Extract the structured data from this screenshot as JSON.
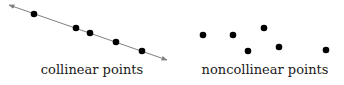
{
  "colors": {
    "point": "#000000",
    "line": "#808080",
    "text": "#1a1a1a",
    "background": "#ffffff"
  },
  "collinear": {
    "label": "collinear points",
    "line": {
      "x1": 9,
      "y1": 5,
      "x2": 167,
      "y2": 60
    },
    "points": [
      [
        34,
        14
      ],
      [
        76,
        28
      ],
      [
        90,
        33
      ],
      [
        116,
        42
      ],
      [
        142,
        51
      ]
    ]
  },
  "noncollinear": {
    "label": "noncollinear points",
    "points": [
      [
        203,
        35
      ],
      [
        233,
        35
      ],
      [
        248,
        51
      ],
      [
        264,
        28
      ],
      [
        279,
        47
      ],
      [
        326,
        50
      ]
    ]
  }
}
